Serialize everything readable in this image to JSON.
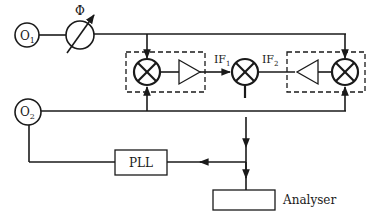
{
  "diagram": {
    "oscillator_1": {
      "label": "O",
      "sub": "1"
    },
    "oscillator_2": {
      "label": "O",
      "sub": "2"
    },
    "phase_shifter": {
      "label": "Φ"
    },
    "if1": {
      "label": "IF",
      "sub": "1"
    },
    "if2": {
      "label": "IF",
      "sub": "2"
    },
    "pll": {
      "label": "PLL"
    },
    "analyser": {
      "label": "Analyser"
    }
  },
  "colors": {
    "stroke": "#1a1a1a",
    "background": "#ffffff"
  }
}
